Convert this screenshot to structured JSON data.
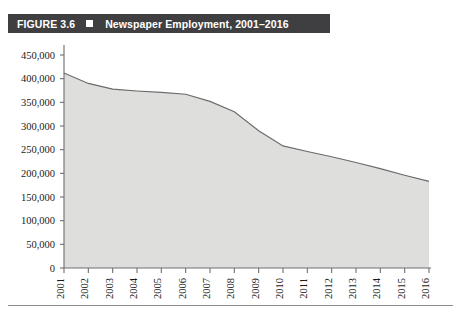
{
  "figure": {
    "number_label": "FIGURE 3.6",
    "title": "Newspaper Employment, 2001–2016",
    "marker_icon": "filled-square-icon",
    "bar_color": "#3f3f41",
    "bar_text_color": "#ffffff"
  },
  "chart_data": {
    "type": "area",
    "title": "Newspaper Employment, 2001–2016",
    "xlabel": "",
    "ylabel": "",
    "categories": [
      "2001",
      "2002",
      "2003",
      "2004",
      "2005",
      "2006",
      "2007",
      "2008",
      "2009",
      "2010",
      "2011",
      "2012",
      "2013",
      "2014",
      "2015",
      "2016"
    ],
    "values": [
      412000,
      390000,
      378000,
      374000,
      371000,
      367000,
      352000,
      330000,
      290000,
      258000,
      246000,
      235000,
      223000,
      210000,
      196000,
      183000
    ],
    "series": [
      {
        "name": "Newspaper Employment",
        "values": [
          412000,
          390000,
          378000,
          374000,
          371000,
          367000,
          352000,
          330000,
          290000,
          258000,
          246000,
          235000,
          223000,
          210000,
          196000,
          183000
        ]
      }
    ],
    "ylim": [
      0,
      450000
    ],
    "ytick_values": [
      0,
      50000,
      100000,
      150000,
      200000,
      250000,
      300000,
      350000,
      400000,
      450000
    ],
    "ytick_labels": [
      "0",
      "50,000",
      "100,000",
      "150,000",
      "200,000",
      "250,000",
      "300,000",
      "350,000",
      "400,000",
      "450,000"
    ],
    "xtick_labels": [
      "2001",
      "2002",
      "2003",
      "2004",
      "2005",
      "2006",
      "2007",
      "2008",
      "2009",
      "2010",
      "2011",
      "2012",
      "2013",
      "2014",
      "2015",
      "2016"
    ],
    "xtick_rotation": -90,
    "grid": false,
    "legend": false,
    "legend_position": "none",
    "area_fill_color": "#dededd",
    "line_color": "#6a6a6a",
    "axis_color": "#6e6e6e"
  }
}
